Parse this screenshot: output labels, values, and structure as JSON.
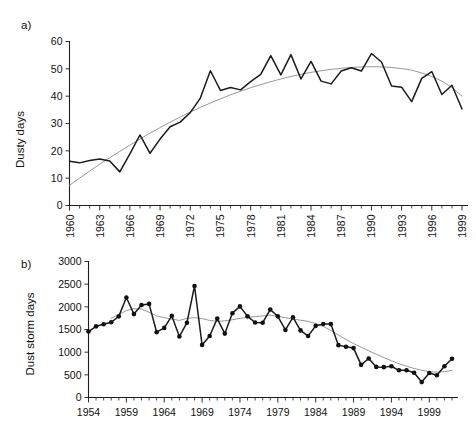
{
  "figure": {
    "background": "#ffffff",
    "series_color": "#1b1b1b",
    "trend_color": "#8c8c8c"
  },
  "panels": {
    "a": {
      "tag": "a)"
    },
    "b": {
      "tag": "b)"
    }
  },
  "chart_data": [
    {
      "type": "line",
      "panel": "a)",
      "title": "",
      "xlabel": "",
      "ylabel": "Dusty days",
      "xlim": [
        1960,
        1999
      ],
      "ylim": [
        0,
        60
      ],
      "grid": false,
      "legend": "none",
      "yticks": [
        0,
        10,
        20,
        30,
        40,
        50,
        60
      ],
      "xticks": [
        1960,
        1963,
        1966,
        1969,
        1972,
        1975,
        1978,
        1981,
        1984,
        1987,
        1990,
        1993,
        1996,
        1999
      ],
      "xticklabels": [
        "1960",
        "1963",
        "1966",
        "1969",
        "1972",
        "1975",
        "1978",
        "1981",
        "1984",
        "1987",
        "1990",
        "1993",
        "1996",
        "1999"
      ],
      "xtick_minor_step": 1,
      "x": [
        1960,
        1961,
        1962,
        1963,
        1964,
        1965,
        1966,
        1967,
        1968,
        1969,
        1970,
        1971,
        1972,
        1973,
        1974,
        1975,
        1976,
        1977,
        1978,
        1979,
        1980,
        1981,
        1982,
        1983,
        1984,
        1985,
        1986,
        1987,
        1988,
        1989,
        1990,
        1991,
        1992,
        1993,
        1994,
        1995,
        1996,
        1997,
        1998,
        1999
      ],
      "series": [
        {
          "name": "Dusty days",
          "marker": "none",
          "values": [
            16.2,
            15.6,
            16.5,
            17.0,
            16.3,
            12.3,
            18.9,
            25.8,
            19.1,
            24.3,
            28.8,
            30.5,
            34.0,
            39.3,
            49.3,
            42.1,
            43.2,
            42.3,
            45.3,
            48.0,
            54.8,
            47.8,
            55.2,
            46.3,
            52.7,
            45.5,
            44.5,
            49.2,
            50.4,
            49.2,
            55.6,
            52.5,
            43.7,
            43.3,
            38.0,
            46.5,
            49.0,
            40.6,
            44.0,
            35.3
          ]
        },
        {
          "name": "Polynomial trend",
          "style": "trend",
          "marker": "none",
          "values": [
            7.4,
            10.0,
            12.6,
            15.1,
            17.5,
            19.8,
            22.1,
            24.3,
            26.5,
            28.5,
            30.5,
            32.4,
            34.2,
            35.9,
            37.5,
            39.0,
            40.5,
            41.8,
            43.1,
            44.2,
            45.3,
            46.3,
            47.2,
            48.0,
            48.7,
            49.3,
            49.8,
            50.2,
            50.5,
            50.7,
            50.8,
            50.7,
            50.5,
            50.1,
            49.5,
            48.5,
            47.2,
            45.5,
            43.2,
            40.0
          ]
        }
      ]
    },
    {
      "type": "line",
      "panel": "b)",
      "title": "",
      "xlabel": "",
      "ylabel": "Dust storm days",
      "xlim": [
        1954,
        2002
      ],
      "ylim": [
        0,
        3000
      ],
      "grid": false,
      "legend": "none",
      "yticks": [
        0,
        500,
        1000,
        1500,
        2000,
        2500,
        3000
      ],
      "xticks": [
        1954,
        1959,
        1964,
        1969,
        1974,
        1979,
        1984,
        1989,
        1994,
        1999
      ],
      "xticklabels": [
        "1954",
        "1959",
        "1964",
        "1969",
        "1974",
        "1979",
        "1984",
        "1989",
        "1994",
        "1999"
      ],
      "xtick_minor_step": 1,
      "x": [
        1954,
        1955,
        1956,
        1957,
        1958,
        1959,
        1960,
        1961,
        1962,
        1963,
        1964,
        1965,
        1966,
        1967,
        1968,
        1969,
        1970,
        1971,
        1972,
        1973,
        1974,
        1975,
        1976,
        1977,
        1978,
        1979,
        1980,
        1981,
        1982,
        1983,
        1984,
        1985,
        1986,
        1987,
        1988,
        1989,
        1990,
        1991,
        1992,
        1993,
        1994,
        1995,
        1996,
        1997,
        1998,
        1999,
        2000,
        2001,
        2002
      ],
      "series": [
        {
          "name": "Dust storm days",
          "marker": "circle",
          "values": [
            1455,
            1570,
            1615,
            1660,
            1790,
            2205,
            1840,
            2040,
            2065,
            1440,
            1535,
            1800,
            1345,
            1650,
            2460,
            1160,
            1355,
            1740,
            1410,
            1860,
            2010,
            1790,
            1655,
            1650,
            1940,
            1790,
            1490,
            1770,
            1480,
            1355,
            1580,
            1620,
            1620,
            1155,
            1120,
            1090,
            720,
            860,
            675,
            670,
            690,
            600,
            600,
            545,
            340,
            540,
            490,
            690,
            855
          ]
        },
        {
          "name": "Smoothed trend",
          "style": "trend",
          "marker": "none",
          "values": [
            null,
            null,
            null,
            1745,
            1830,
            1915,
            1960,
            1950,
            1880,
            1800,
            1760,
            1730,
            1700,
            1745,
            1760,
            1740,
            1700,
            1680,
            1690,
            1715,
            1745,
            1770,
            1785,
            1800,
            1815,
            1790,
            1760,
            1730,
            1705,
            1680,
            1630,
            1570,
            1480,
            1380,
            1280,
            1190,
            1110,
            1030,
            955,
            880,
            810,
            745,
            690,
            640,
            600,
            570,
            560,
            570,
            600
          ]
        }
      ]
    }
  ]
}
